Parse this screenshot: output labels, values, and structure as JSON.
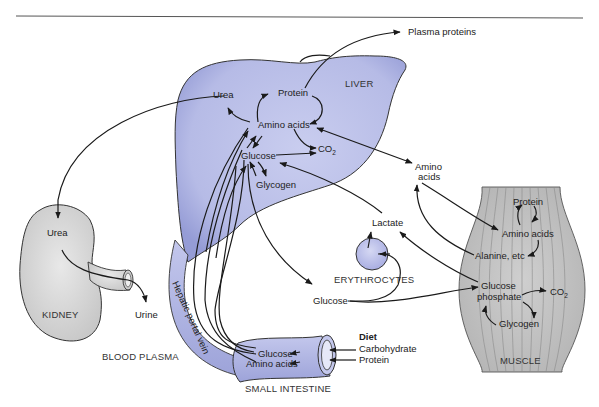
{
  "diagram": {
    "colors": {
      "organ_blue": "#b9bde6",
      "organ_blue_dark": "#9aa0d8",
      "kidney_gray": "#d9d9d9",
      "muscle_gray": "#c4c4c4",
      "line": "#1a1a1a",
      "rule": "#555555"
    },
    "liver": {
      "label": "LIVER",
      "nodes": {
        "urea": "Urea",
        "protein": "Protein",
        "amino_acids": "Amino acids",
        "glucose": "Glucose",
        "co2": "CO",
        "co2_sub": "2",
        "glycogen": "Glycogen"
      }
    },
    "plasma_proteins": "Plasma proteins",
    "blood_amino_acids_line1": "Amino",
    "blood_amino_acids_line2": "acids",
    "kidney": {
      "label": "KIDNEY",
      "urea": "Urea",
      "urine": "Urine"
    },
    "blood_plasma": "BLOOD PLASMA",
    "hepatic_portal_vein": "Hepatic portal vein",
    "erythrocytes": {
      "label": "ERYTHROCYTES",
      "lactate": "Lactate"
    },
    "blood_glucose": "Glucose",
    "small_intestine": {
      "label": "SMALL INTESTINE",
      "glucose": "Glucose",
      "amino_acids": "Amino acids"
    },
    "diet": {
      "title": "Diet",
      "carbohydrate": "Carbohydrate",
      "protein": "Protein"
    },
    "muscle": {
      "label": "MUSCLE",
      "protein": "Protein",
      "amino_acids": "Amino acids",
      "alanine": "Alanine, etc",
      "glucose_phosphate_line1": "Glucose",
      "glucose_phosphate_line2": "phosphate",
      "co2": "CO",
      "co2_sub": "2",
      "glycogen": "Glycogen"
    }
  }
}
